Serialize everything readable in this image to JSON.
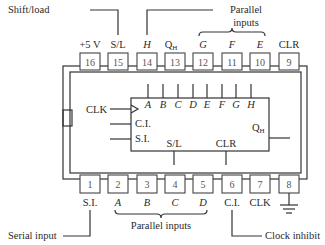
{
  "diagram": {
    "top_pins": [
      {
        "num": "16",
        "label": "+5 V",
        "italic": false
      },
      {
        "num": "15",
        "label": "S/L",
        "italic": false
      },
      {
        "num": "14",
        "label": "H",
        "italic": true
      },
      {
        "num": "13",
        "label": "QH",
        "italic": false
      },
      {
        "num": "12",
        "label": "G",
        "italic": true
      },
      {
        "num": "11",
        "label": "F",
        "italic": true
      },
      {
        "num": "10",
        "label": "E",
        "italic": true
      },
      {
        "num": "9",
        "label": "CLR",
        "italic": false
      }
    ],
    "bottom_pins": [
      {
        "num": "1",
        "label": "S.I.",
        "italic": false
      },
      {
        "num": "2",
        "label": "A",
        "italic": true
      },
      {
        "num": "3",
        "label": "B",
        "italic": true
      },
      {
        "num": "4",
        "label": "C",
        "italic": true
      },
      {
        "num": "5",
        "label": "D",
        "italic": true
      },
      {
        "num": "6",
        "label": "C.I.",
        "italic": false
      },
      {
        "num": "7",
        "label": "CLK",
        "italic": false
      },
      {
        "num": "8",
        "label": "",
        "italic": false
      }
    ],
    "callouts": {
      "shift_load": "Shift/load",
      "parallel_inputs_top_1": "Parallel",
      "parallel_inputs_top_2": "inputs",
      "parallel_inputs_bottom": "Parallel inputs",
      "serial_input": "Serial input",
      "clock_inhibit": "Clock inhibit"
    },
    "inner_block": {
      "inputs_top": [
        "A",
        "B",
        "C",
        "D",
        "E",
        "F",
        "G",
        "H"
      ],
      "clk": "CLK",
      "ci": "C.I.",
      "si": "S.I.",
      "sl": "S/L",
      "clr": "CLR",
      "qh": "Q",
      "qh_sub": "H"
    },
    "qh_top_label": "Q",
    "qh_top_sub": "H",
    "ground_symbol": "ground-icon"
  }
}
